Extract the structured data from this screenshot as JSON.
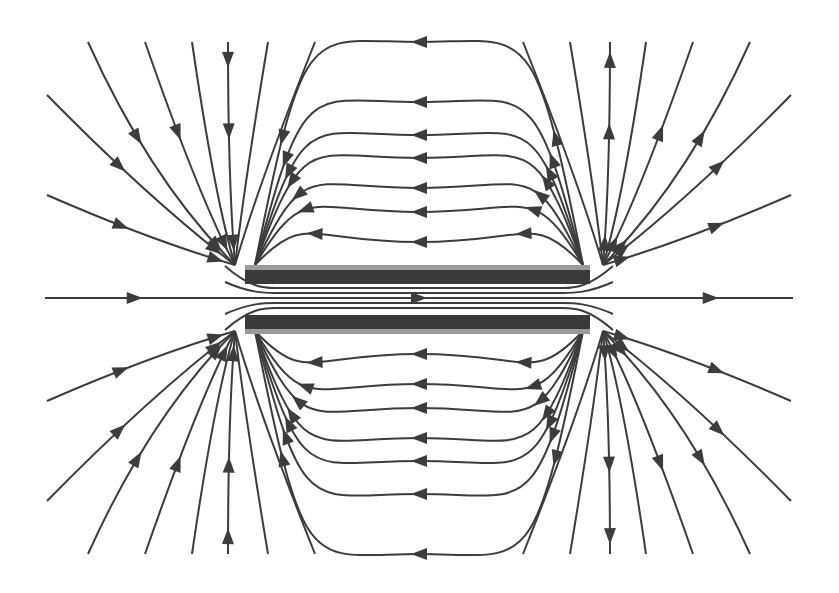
{
  "diagram": {
    "title": "",
    "line_color": "#3c3c3c",
    "plate_color": "#3a3a3a",
    "plate_edge_color": "#9a9a9a",
    "plates": [
      {
        "name": "top-plate"
      },
      {
        "name": "bottom-plate"
      }
    ],
    "direction": "left-to-right through gap; loops return over top and bottom"
  }
}
